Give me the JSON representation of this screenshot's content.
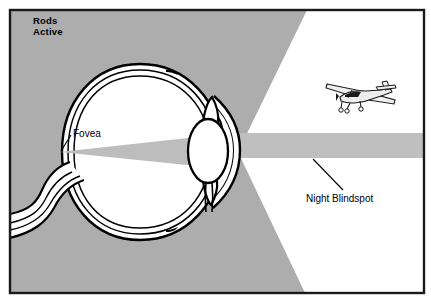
{
  "labels": {
    "rods_active": "Rods\nActive",
    "rods_active_line1": "Rods",
    "rods_active_line2": "Active",
    "fovea": "Fovea",
    "night_blindspot": "Night Blindspot"
  },
  "colors": {
    "background_gray": "#adadad",
    "beam_gray": "#bfbfbf",
    "cone_gray": "#bdbdbd",
    "white": "#ffffff",
    "outline_black": "#000000",
    "border_black": "#1a1a1a",
    "plane_body": "#e8e8e8",
    "plane_dark": "#1a1a1a"
  },
  "geometry": {
    "canvas_width": 431,
    "canvas_height": 300,
    "frame": {
      "x": 9,
      "y": 9,
      "width": 416,
      "height": 285
    },
    "eye_center": {
      "x": 140,
      "y": 152
    },
    "eye_radius_x": 78,
    "eye_radius_y": 85,
    "fovea_point": {
      "x": 60,
      "y": 152
    },
    "lens_center": {
      "x": 212,
      "y": 149
    },
    "beam_band": {
      "y_top": 133,
      "y_bottom": 158,
      "x_start": 205,
      "x_end": 425
    },
    "plane": {
      "x": 325,
      "y": 76,
      "width": 72,
      "height": 38
    }
  },
  "elements": {
    "eye_name": "human-eye-cross-section",
    "optic_nerve_name": "optic-nerve",
    "lens_name": "eye-lens",
    "cornea_name": "cornea",
    "iris_name": "iris",
    "retina_name": "retina",
    "cone_name": "fovea-vision-cone",
    "beam_name": "night-blindspot-beam",
    "plane_name": "airplane-icon",
    "wedge_top_name": "peripheral-vision-wedge-top",
    "wedge_bottom_name": "peripheral-vision-wedge-bottom"
  }
}
